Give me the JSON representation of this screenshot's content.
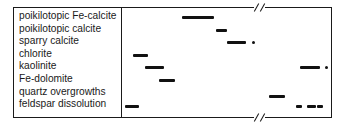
{
  "diagram": {
    "type": "paragenetic-sequence",
    "rows": [
      {
        "label": "poikilotopic Fe-calcite",
        "segments": [
          {
            "x1": 182,
            "x2": 214
          }
        ],
        "dots": []
      },
      {
        "label": "poikilotopic calcite",
        "segments": [
          {
            "x1": 216,
            "x2": 227
          }
        ],
        "dots": []
      },
      {
        "label": "sparry calcite",
        "segments": [
          {
            "x1": 227,
            "x2": 246
          }
        ],
        "dots": [
          252
        ]
      },
      {
        "label": "chlorite",
        "segments": [
          {
            "x1": 133,
            "x2": 148
          }
        ],
        "dots": []
      },
      {
        "label": "kaolinite",
        "segments": [
          {
            "x1": 145,
            "x2": 164
          },
          {
            "x1": 300,
            "x2": 320
          }
        ],
        "dots": [
          325
        ]
      },
      {
        "label": "Fe-dolomite",
        "segments": [
          {
            "x1": 159,
            "x2": 175
          }
        ],
        "dots": []
      },
      {
        "label": "quartz overgrowths",
        "segments": [
          {
            "x1": 269,
            "x2": 285
          }
        ],
        "dots": []
      },
      {
        "label": "feldspar dissolution",
        "segments": [
          {
            "x1": 125,
            "x2": 139
          },
          {
            "x1": 296,
            "x2": 302
          },
          {
            "x1": 307,
            "x2": 316
          },
          {
            "x1": 317,
            "x2": 323
          }
        ],
        "dots": []
      }
    ],
    "axis_break": {
      "x_start": 254,
      "x_end": 265,
      "symbol": "//"
    },
    "line_color": "#1a1a1a",
    "bar_color": "#111111"
  }
}
